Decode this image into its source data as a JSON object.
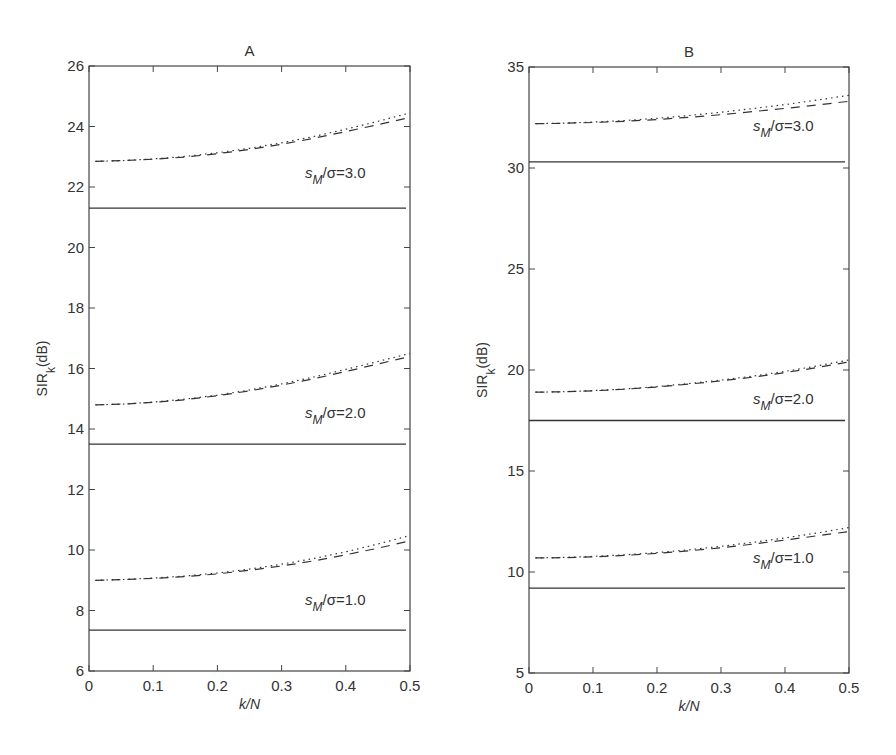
{
  "chart_data": [
    {
      "type": "line",
      "panel": "A",
      "title": "A",
      "xlabel": "k/N",
      "ylabel": "SIR_k (dB)",
      "xlim": [
        0,
        0.5
      ],
      "ylim": [
        6,
        26
      ],
      "xticks": [
        "0",
        "0.1",
        "0.2",
        "0.3",
        "0.4",
        "0.5"
      ],
      "yticks": [
        "6",
        "8",
        "10",
        "12",
        "14",
        "16",
        "18",
        "20",
        "22",
        "24",
        "26"
      ],
      "grid": false,
      "x": [
        0.01,
        0.05,
        0.1,
        0.15,
        0.2,
        0.25,
        0.3,
        0.35,
        0.4,
        0.45,
        0.5
      ],
      "groups": [
        {
          "annotation": "s_M/σ=3.0",
          "series": [
            {
              "name": "solid",
              "style": "solid",
              "values": [
                21.3,
                21.3,
                21.3,
                21.3,
                21.3,
                21.3,
                21.3,
                21.3,
                21.3,
                21.3,
                21.3
              ]
            },
            {
              "name": "dashed",
              "style": "dashed",
              "values": [
                22.85,
                22.87,
                22.92,
                22.99,
                23.1,
                23.24,
                23.41,
                23.61,
                23.83,
                24.06,
                24.3
              ]
            },
            {
              "name": "dotted",
              "style": "dotted",
              "values": [
                22.85,
                22.87,
                22.93,
                23.01,
                23.13,
                23.28,
                23.46,
                23.67,
                23.91,
                24.17,
                24.45
              ]
            }
          ]
        },
        {
          "annotation": "s_M/σ=2.0",
          "series": [
            {
              "name": "solid",
              "style": "solid",
              "values": [
                13.5,
                13.5,
                13.5,
                13.5,
                13.5,
                13.5,
                13.5,
                13.5,
                13.5,
                13.5,
                13.5
              ]
            },
            {
              "name": "dashed",
              "style": "dashed",
              "values": [
                14.8,
                14.82,
                14.88,
                14.97,
                15.1,
                15.26,
                15.45,
                15.66,
                15.9,
                16.15,
                16.4
              ]
            },
            {
              "name": "dotted",
              "style": "dotted",
              "values": [
                14.8,
                14.82,
                14.89,
                14.99,
                15.12,
                15.29,
                15.49,
                15.72,
                15.97,
                16.23,
                16.5
              ]
            }
          ]
        },
        {
          "annotation": "s_M/σ=1.0",
          "series": [
            {
              "name": "solid",
              "style": "solid",
              "values": [
                7.35,
                7.35,
                7.35,
                7.35,
                7.35,
                7.35,
                7.35,
                7.35,
                7.35,
                7.35,
                7.35
              ]
            },
            {
              "name": "dashed",
              "style": "dashed",
              "values": [
                9.0,
                9.02,
                9.06,
                9.12,
                9.21,
                9.33,
                9.47,
                9.64,
                9.84,
                10.06,
                10.3
              ]
            },
            {
              "name": "dotted",
              "style": "dotted",
              "values": [
                9.0,
                9.02,
                9.07,
                9.14,
                9.24,
                9.37,
                9.53,
                9.72,
                9.94,
                10.2,
                10.48
              ]
            }
          ]
        }
      ]
    },
    {
      "type": "line",
      "panel": "B",
      "title": "B",
      "xlabel": "k/N",
      "ylabel": "SIR_k (dB)",
      "xlim": [
        0,
        0.5
      ],
      "ylim": [
        5,
        35
      ],
      "xticks": [
        "0",
        "0.1",
        "0.2",
        "0.3",
        "0.4",
        "0.5"
      ],
      "yticks": [
        "5",
        "10",
        "15",
        "20",
        "25",
        "30",
        "35"
      ],
      "grid": false,
      "x": [
        0.01,
        0.05,
        0.1,
        0.15,
        0.2,
        0.25,
        0.3,
        0.35,
        0.4,
        0.45,
        0.5
      ],
      "groups": [
        {
          "annotation": "s_M/σ=3.0",
          "series": [
            {
              "name": "solid",
              "style": "solid",
              "values": [
                30.3,
                30.3,
                30.3,
                30.3,
                30.3,
                30.3,
                30.3,
                30.3,
                30.3,
                30.3,
                30.3
              ]
            },
            {
              "name": "dashed",
              "style": "dashed",
              "values": [
                32.2,
                32.21,
                32.25,
                32.31,
                32.4,
                32.51,
                32.64,
                32.79,
                32.95,
                33.12,
                33.3
              ]
            },
            {
              "name": "dotted",
              "style": "dotted",
              "values": [
                32.2,
                32.22,
                32.27,
                32.35,
                32.46,
                32.6,
                32.76,
                32.94,
                33.14,
                33.36,
                33.6
              ]
            }
          ]
        },
        {
          "annotation": "s_M/σ=2.0",
          "series": [
            {
              "name": "solid",
              "style": "solid",
              "values": [
                17.5,
                17.5,
                17.5,
                17.5,
                17.5,
                17.5,
                17.5,
                17.5,
                17.5,
                17.5,
                17.5
              ]
            },
            {
              "name": "dashed",
              "style": "dashed",
              "values": [
                18.9,
                18.92,
                18.97,
                19.05,
                19.16,
                19.3,
                19.46,
                19.65,
                19.87,
                20.12,
                20.4
              ]
            },
            {
              "name": "dotted",
              "style": "dotted",
              "values": [
                18.9,
                18.92,
                18.98,
                19.06,
                19.18,
                19.33,
                19.5,
                19.7,
                19.93,
                20.2,
                20.5
              ]
            }
          ]
        },
        {
          "annotation": "s_M/σ=1.0",
          "series": [
            {
              "name": "solid",
              "style": "solid",
              "values": [
                9.2,
                9.2,
                9.2,
                9.2,
                9.2,
                9.2,
                9.2,
                9.2,
                9.2,
                9.2,
                9.2
              ]
            },
            {
              "name": "dashed",
              "style": "dashed",
              "values": [
                10.7,
                10.71,
                10.75,
                10.82,
                10.92,
                11.05,
                11.2,
                11.38,
                11.58,
                11.79,
                12.0
              ]
            },
            {
              "name": "dotted",
              "style": "dotted",
              "values": [
                10.7,
                10.72,
                10.77,
                10.85,
                10.96,
                11.1,
                11.27,
                11.47,
                11.69,
                11.93,
                12.2
              ]
            }
          ]
        }
      ]
    }
  ],
  "panels": [
    {
      "title": "A",
      "xlabel": "k/N",
      "ylabel_main": "SIR",
      "ylabel_sub": "k",
      "ylabel_unit": "(dB)",
      "annotations": [
        {
          "prefix": "s",
          "sub": "M",
          "suffix": "/σ=3.0"
        },
        {
          "prefix": "s",
          "sub": "M",
          "suffix": "/σ=2.0"
        },
        {
          "prefix": "s",
          "sub": "M",
          "suffix": "/σ=1.0"
        }
      ]
    },
    {
      "title": "B",
      "xlabel": "k/N",
      "ylabel_main": "SIR",
      "ylabel_sub": "k",
      "ylabel_unit": "(dB)",
      "annotations": [
        {
          "prefix": "s",
          "sub": "M",
          "suffix": "/σ=3.0"
        },
        {
          "prefix": "s",
          "sub": "M",
          "suffix": "/σ=2.0"
        },
        {
          "prefix": "s",
          "sub": "M",
          "suffix": "/σ=1.0"
        }
      ]
    }
  ],
  "colors": {
    "line": "#333333",
    "axis": "#444444",
    "background": "#ffffff"
  }
}
